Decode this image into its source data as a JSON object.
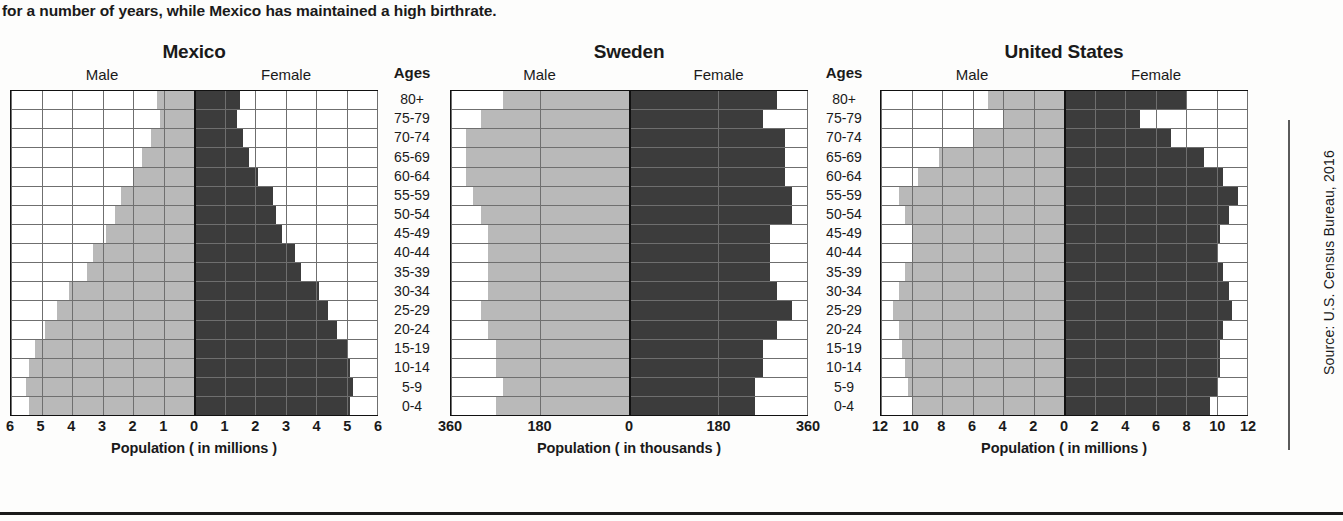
{
  "intro_text": "for a number of years, while Mexico has maintained a high birthrate.",
  "source_note": "Source: U.S. Census Bureau, 2016",
  "labels": {
    "male": "Male",
    "female": "Female",
    "ages_header": "Ages"
  },
  "age_groups": [
    "80+",
    "75-79",
    "70-74",
    "65-69",
    "60-64",
    "55-59",
    "50-54",
    "45-49",
    "40-44",
    "35-39",
    "30-34",
    "25-29",
    "20-24",
    "15-19",
    "10-14",
    "5-9",
    "0-4"
  ],
  "colors": {
    "male_bar": "#b9b9b9",
    "female_bar": "#3c3c3c",
    "gridline": "#6f6f6f",
    "frame": "#111111"
  },
  "chart_data": [
    {
      "type": "bar",
      "title": "Mexico",
      "subtype": "population-pyramid",
      "xlabel": "Population ( in millions )",
      "ylabel": "Ages",
      "units": "millions",
      "xlim": [
        -6,
        6
      ],
      "xticks": [
        6,
        5,
        4,
        3,
        2,
        1,
        0,
        1,
        2,
        3,
        4,
        5,
        6
      ],
      "tick_values": [
        -6,
        -5,
        -4,
        -3,
        -2,
        -1,
        0,
        1,
        2,
        3,
        4,
        5,
        6
      ],
      "grid": true,
      "legend": "none",
      "categories": [
        "80+",
        "75-79",
        "70-74",
        "65-69",
        "60-64",
        "55-59",
        "50-54",
        "45-49",
        "40-44",
        "35-39",
        "30-34",
        "25-29",
        "20-24",
        "15-19",
        "10-14",
        "5-9",
        "0-4"
      ],
      "series": [
        {
          "name": "Male",
          "side": "left",
          "values": [
            1.2,
            1.1,
            1.4,
            1.7,
            2.0,
            2.4,
            2.6,
            2.9,
            3.3,
            3.5,
            4.1,
            4.5,
            4.9,
            5.2,
            5.4,
            5.5,
            5.4
          ]
        },
        {
          "name": "Female",
          "side": "right",
          "values": [
            1.5,
            1.4,
            1.6,
            1.8,
            2.1,
            2.6,
            2.7,
            2.9,
            3.3,
            3.5,
            4.1,
            4.4,
            4.7,
            5.0,
            5.1,
            5.2,
            5.1
          ]
        }
      ]
    },
    {
      "type": "bar",
      "title": "Sweden",
      "subtype": "population-pyramid",
      "xlabel": "Population ( in thousands )",
      "ylabel": "Ages",
      "units": "thousands",
      "xlim": [
        -360,
        360
      ],
      "xticks": [
        360,
        180,
        0,
        180,
        360
      ],
      "tick_values": [
        -360,
        -180,
        0,
        180,
        360
      ],
      "grid": true,
      "legend": "none",
      "categories": [
        "80+",
        "75-79",
        "70-74",
        "65-69",
        "60-64",
        "55-59",
        "50-54",
        "45-49",
        "40-44",
        "35-39",
        "30-34",
        "25-29",
        "20-24",
        "15-19",
        "10-14",
        "5-9",
        "0-4"
      ],
      "series": [
        {
          "name": "Male",
          "side": "left",
          "values": [
            255,
            300,
            330,
            330,
            330,
            315,
            300,
            285,
            285,
            285,
            285,
            300,
            285,
            270,
            270,
            255,
            270
          ]
        },
        {
          "name": "Female",
          "side": "right",
          "values": [
            300,
            270,
            315,
            315,
            315,
            330,
            330,
            285,
            285,
            285,
            300,
            330,
            300,
            270,
            270,
            255,
            255
          ]
        }
      ]
    },
    {
      "type": "bar",
      "title": "United States",
      "subtype": "population-pyramid",
      "xlabel": "Population ( in millions )",
      "ylabel": "Ages",
      "units": "millions",
      "xlim": [
        -12,
        12
      ],
      "xticks": [
        12,
        10,
        8,
        6,
        4,
        2,
        0,
        2,
        4,
        6,
        8,
        10,
        12
      ],
      "tick_values": [
        -12,
        -10,
        -8,
        -6,
        -4,
        -2,
        0,
        2,
        4,
        6,
        8,
        10,
        12
      ],
      "grid": true,
      "legend": "none",
      "categories": [
        "80+",
        "75-79",
        "70-74",
        "65-69",
        "60-64",
        "55-59",
        "50-54",
        "45-49",
        "40-44",
        "35-39",
        "30-34",
        "25-29",
        "20-24",
        "15-19",
        "10-14",
        "5-9",
        "0-4"
      ],
      "series": [
        {
          "name": "Male",
          "side": "left",
          "values": [
            5.0,
            4.0,
            6.0,
            8.2,
            9.6,
            10.8,
            10.4,
            10.0,
            10.0,
            10.4,
            10.8,
            11.2,
            10.8,
            10.6,
            10.4,
            10.2,
            10.0
          ]
        },
        {
          "name": "Female",
          "side": "right",
          "values": [
            8.0,
            5.0,
            7.0,
            9.2,
            10.4,
            11.4,
            10.8,
            10.2,
            10.0,
            10.4,
            10.8,
            11.0,
            10.4,
            10.2,
            10.2,
            10.0,
            9.6
          ]
        }
      ]
    }
  ]
}
